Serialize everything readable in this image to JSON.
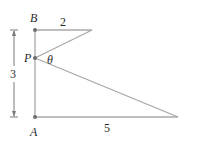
{
  "diagram": {
    "points": {
      "B": {
        "label": "B"
      },
      "P": {
        "label": "P"
      },
      "A": {
        "label": "A"
      }
    },
    "lengths": {
      "top": "2",
      "bottom": "5",
      "height": "3"
    },
    "angle": "θ",
    "colors": {
      "line": "#a8a8a8",
      "point": "#6e6e6e",
      "text": "#2b2b2b"
    }
  }
}
